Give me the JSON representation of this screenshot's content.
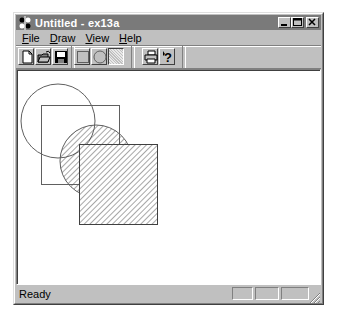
{
  "window": {
    "title": "Untitled - ex13a",
    "caption_buttons": [
      {
        "name": "minimize-button",
        "glyph": "_"
      },
      {
        "name": "maximize-button",
        "glyph": "□"
      },
      {
        "name": "close-button",
        "glyph": "×"
      }
    ]
  },
  "menu": {
    "items": [
      {
        "label": "File",
        "accel": "F",
        "rest": "ile"
      },
      {
        "label": "Draw",
        "accel": "D",
        "rest": "raw"
      },
      {
        "label": "View",
        "accel": "V",
        "rest": "iew"
      },
      {
        "label": "Help",
        "accel": "H",
        "rest": "elp"
      }
    ]
  },
  "toolbar": {
    "buttons": [
      {
        "name": "new-button",
        "icon": "new-document-icon"
      },
      {
        "name": "open-button",
        "icon": "open-folder-icon"
      },
      {
        "name": "save-button",
        "icon": "floppy-disk-icon"
      },
      {
        "name": "rectangle-button",
        "icon": "rectangle-icon"
      },
      {
        "name": "circle-button",
        "icon": "circle-icon"
      },
      {
        "name": "pattern-button",
        "icon": "hatch-pattern-icon",
        "pressed": true
      },
      {
        "name": "print-button",
        "icon": "printer-icon"
      },
      {
        "name": "help-button",
        "icon": "context-help-icon"
      }
    ]
  },
  "canvas": {
    "shapes": [
      {
        "type": "ellipse",
        "cx": 41,
        "cy": 51,
        "r": 37,
        "fill": "none"
      },
      {
        "type": "rect",
        "x": 24,
        "y": 35,
        "w": 78,
        "h": 79,
        "fill": "none"
      },
      {
        "type": "ellipse",
        "cx": 79,
        "cy": 91,
        "r": 36,
        "fill": "hatch"
      },
      {
        "type": "rect",
        "x": 62,
        "y": 74,
        "w": 78,
        "h": 80,
        "fill": "hatch"
      }
    ],
    "stroke_color": "#606060",
    "hatch_color": "#505050"
  },
  "statusbar": {
    "text": "Ready",
    "panes": [
      "",
      "",
      ""
    ]
  },
  "colors": {
    "titlebar_inactive": "#7a7a7a",
    "face": "#c0c0c0"
  }
}
